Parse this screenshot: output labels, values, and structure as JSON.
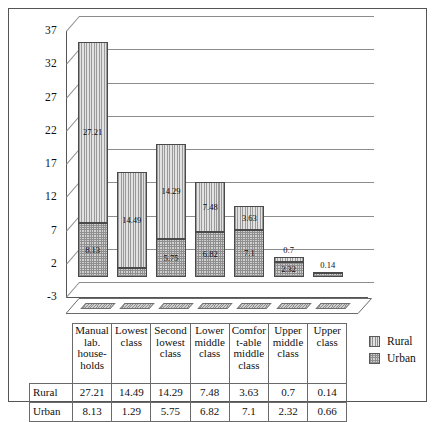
{
  "chart_data": {
    "type": "bar",
    "subtype": "stacked-column-3d",
    "title": "",
    "xlabel": "",
    "ylabel": "",
    "categories": [
      "Manual lab. house-holds",
      "Lowest class",
      "Second lowest class",
      "Lower middle class",
      "Comfor t-able middle class",
      "Upper middle class",
      "Upper class"
    ],
    "series": [
      {
        "name": "Rural",
        "values": [
          27.21,
          14.49,
          14.29,
          7.48,
          3.63,
          0.7,
          0.14
        ]
      },
      {
        "name": "Urban",
        "values": [
          8.13,
          1.29,
          5.75,
          6.82,
          7.1,
          2.32,
          0.66
        ]
      }
    ],
    "stack_order": [
      "Urban",
      "Rural"
    ],
    "ylim": [
      -3,
      37
    ],
    "yticks": [
      "37",
      "32",
      "27",
      "22",
      "17",
      "12",
      "7",
      "2",
      "-3"
    ],
    "ytick_values": [
      37,
      32,
      27,
      22,
      17,
      12,
      7,
      2,
      -3
    ],
    "grid": true,
    "legend_position": "right"
  },
  "legend": {
    "items": [
      {
        "label": "Rural",
        "pattern": "vertical-hatch"
      },
      {
        "label": "Urban",
        "pattern": "cross-hatch"
      }
    ]
  },
  "table": {
    "corner": "",
    "headers": [
      "Manual lab. house-holds",
      "Lowest class",
      "Second lowest class",
      "Lower middle class",
      "Comfor t-able middle class",
      "Upper middle class",
      "Upper class"
    ],
    "rows": [
      {
        "label": "Rural",
        "cells": [
          "27.21",
          "14.49",
          "14.29",
          "7.48",
          "3.63",
          "0.7",
          "0.14"
        ]
      },
      {
        "label": "Urban",
        "cells": [
          "8.13",
          "1.29",
          "5.75",
          "6.82",
          "7.1",
          "2.32",
          "0.66"
        ]
      }
    ]
  },
  "colors": {
    "axis": "#555555",
    "grid": "#8d8d8d",
    "rural_fill": "#d6d6d6",
    "urban_fill": "#d0d0d0",
    "text": "#101010"
  }
}
